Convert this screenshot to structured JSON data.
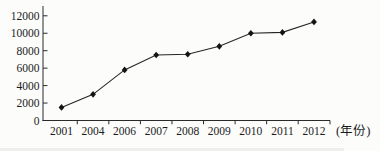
{
  "chart_data": {
    "type": "line",
    "title": "",
    "categories": [
      "2001",
      "2004",
      "2006",
      "2007",
      "2008",
      "2009",
      "2010",
      "2011",
      "2012"
    ],
    "values": [
      1500,
      3000,
      5800,
      7500,
      7600,
      8500,
      10000,
      10100,
      11300
    ],
    "series": [
      {
        "name": "value-by-year",
        "values": [
          1500,
          3000,
          5800,
          7500,
          7600,
          8500,
          10000,
          10100,
          11300
        ]
      }
    ],
    "xlabel": "(年份)",
    "ylabel": "",
    "ylim": [
      0,
      12000
    ],
    "yticks": [
      0,
      2000,
      4000,
      6000,
      8000,
      10000,
      12000
    ],
    "ytick_labels": [
      "0",
      "2000",
      "4000",
      "6000",
      "8000",
      "10000",
      "12000"
    ],
    "grid": false,
    "legend": "none",
    "marker": "diamond",
    "line_color": "#262626",
    "marker_color": "#141414",
    "axis_color": "#2a2a2a",
    "text_color": "#1b1b1b",
    "background": "#fcfcfb"
  }
}
